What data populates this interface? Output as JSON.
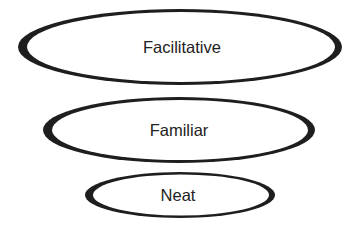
{
  "diagram": {
    "type": "stacked-ellipses",
    "stroke_color": "#1e1e1e",
    "text_color": "#222222",
    "levels": [
      {
        "label": "Facilitative",
        "cx": 180,
        "cy": 47,
        "rx": 162,
        "ry": 38
      },
      {
        "label": "Familiar",
        "cx": 179,
        "cy": 130,
        "rx": 136,
        "ry": 33
      },
      {
        "label": "Neat",
        "cx": 180,
        "cy": 195,
        "rx": 95,
        "ry": 23
      }
    ]
  }
}
